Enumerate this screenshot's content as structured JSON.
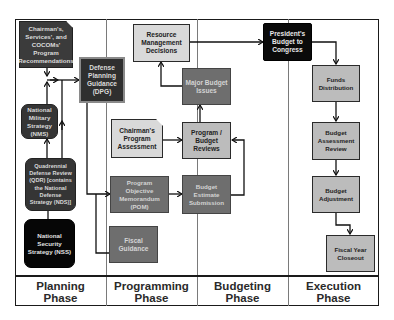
{
  "diagram": {
    "phases": [
      {
        "id": "planning",
        "label_line1": "Planning",
        "label_line2": "Phase"
      },
      {
        "id": "programming",
        "label_line1": "Programming",
        "label_line2": "Phase"
      },
      {
        "id": "budgeting",
        "label_line1": "Budgeting",
        "label_line2": "Phase"
      },
      {
        "id": "execution",
        "label_line1": "Execution",
        "label_line2": "Phase"
      }
    ],
    "nodes": {
      "chairmans_recs": "Chairman's, Services', and COCOMs' Program Recommendations",
      "nms": "National Military Strategy (NMS)",
      "qdr": "Quadrennial Defense Review (QDR) [contains the National Defense Strategy (NDS)]",
      "nss": "National Security Strategy (NSS)",
      "dpg": "Defense Planning Guidance (DPG)",
      "cpa": "Chairman's Program Assessment",
      "pom": "Program Objective Memorandum (POM)",
      "fiscal_guidance": "Fiscal Guidance",
      "rmd": "Resource Management Decisions",
      "major_budget_issues": "Major Budget Issues",
      "program_budget_reviews": "Program / Budget Reviews",
      "budget_estimate_submission": "Budget Estimate Submission",
      "presidents_budget": "President's Budget to Congress",
      "funds_distribution": "Funds Distribution",
      "budget_assessment_review": "Budget Assessment Review",
      "budget_adjustment": "Budget Adjustment",
      "fiscal_year_closeout": "Fiscal Year Closeout"
    },
    "edges": [
      [
        "nss",
        "qdr"
      ],
      [
        "qdr",
        "nms"
      ],
      [
        "nms",
        "chairmans_recs"
      ],
      [
        "chairmans_recs",
        "dpg"
      ],
      [
        "qdr",
        "dpg"
      ],
      [
        "dpg",
        "pom"
      ],
      [
        "dpg",
        "fiscal_guidance"
      ],
      [
        "pom",
        "budget_estimate_submission"
      ],
      [
        "cpa",
        "program_budget_reviews"
      ],
      [
        "budget_estimate_submission",
        "program_budget_reviews"
      ],
      [
        "program_budget_reviews",
        "major_budget_issues"
      ],
      [
        "major_budget_issues",
        "rmd"
      ],
      [
        "rmd",
        "presidents_budget"
      ],
      [
        "presidents_budget",
        "funds_distribution"
      ],
      [
        "funds_distribution",
        "budget_assessment_review"
      ],
      [
        "budget_assessment_review",
        "budget_adjustment"
      ],
      [
        "budget_adjustment",
        "fiscal_year_closeout"
      ]
    ]
  }
}
